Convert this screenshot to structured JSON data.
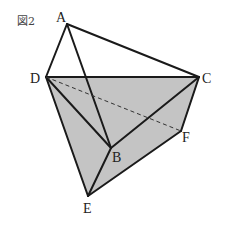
{
  "figure": {
    "caption": "図2",
    "fill_color": "#c4c4c4",
    "line_color": "#1a1a1a",
    "points": {
      "A": {
        "x": 67,
        "y": 24
      },
      "D": {
        "x": 46,
        "y": 77
      },
      "C": {
        "x": 199,
        "y": 77
      },
      "B": {
        "x": 111,
        "y": 148
      },
      "F": {
        "x": 181,
        "y": 131
      },
      "E": {
        "x": 88,
        "y": 196
      }
    },
    "labels": {
      "A": "A",
      "B": "B",
      "C": "C",
      "D": "D",
      "E": "E",
      "F": "F"
    },
    "shaded_region": [
      "D",
      "C",
      "F",
      "E"
    ],
    "solid_edges": [
      [
        "A",
        "D"
      ],
      [
        "A",
        "C"
      ],
      [
        "A",
        "B"
      ],
      [
        "D",
        "C"
      ],
      [
        "D",
        "B"
      ],
      [
        "D",
        "E"
      ],
      [
        "C",
        "B"
      ],
      [
        "C",
        "F"
      ],
      [
        "F",
        "E"
      ],
      [
        "B",
        "E"
      ]
    ],
    "dashed_edges": [
      [
        "D",
        "F"
      ]
    ]
  }
}
